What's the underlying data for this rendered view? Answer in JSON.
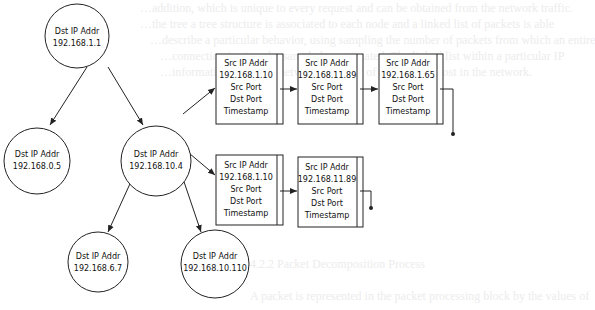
{
  "background_text": {
    "lines": [
      "…addition, which is unique to every request and can be obtained from the network traffic.",
      "…the tree a tree structure is associated to each node and a linked list of packets is able",
      "…describe a particular behavior, using sampling the number of packets from which an entire",
      "…connection is given be sampled or estimated. The linked list within a particular IP",
      "…information about the network behavior of a particular host in the network.",
      "…Packet Processing Block",
      "A packet is represented in the packet processing block by the values of"
    ],
    "heading": "4.2.2  Packet Decomposition Process"
  },
  "tree": {
    "nodes": [
      {
        "id": "root",
        "title": "Dst IP Addr",
        "ip": "192.168.1.1"
      },
      {
        "id": "left",
        "title": "Dst IP Addr",
        "ip": "192.168.0.5"
      },
      {
        "id": "mid",
        "title": "Dst IP Addr",
        "ip": "192.168.10.4"
      },
      {
        "id": "bl",
        "title": "Dst IP Addr",
        "ip": "192.168.6.7"
      },
      {
        "id": "br",
        "title": "Dst IP Addr",
        "ip": "192.168.10.110"
      }
    ]
  },
  "packet_lists": {
    "top": [
      {
        "title": "Src IP Addr",
        "ip": "192.168.1.10",
        "f1": "Src Port",
        "f2": "Dst Port",
        "f3": "Timestamp"
      },
      {
        "title": "Src IP Addr",
        "ip": "192.168.11.89",
        "f1": "Src Port",
        "f2": "Dst Port",
        "f3": "Timestamp"
      },
      {
        "title": "Src IP Addr",
        "ip": "192.168.1.65",
        "f1": "Src Port",
        "f2": "Dst Port",
        "f3": "Timestamp"
      }
    ],
    "bottom": [
      {
        "title": "Src IP Addr",
        "ip": "192.168.1.10",
        "f1": "Src Port",
        "f2": "Dst Port",
        "f3": "Timestamp"
      },
      {
        "title": "Src IP Addr",
        "ip": "192.168.11.89",
        "f1": "Src Port",
        "f2": "Dst Port",
        "f3": "Timestamp"
      }
    ]
  },
  "colors": {
    "stroke": "#222222",
    "text": "#111111",
    "ghost_text": "#ececec"
  }
}
